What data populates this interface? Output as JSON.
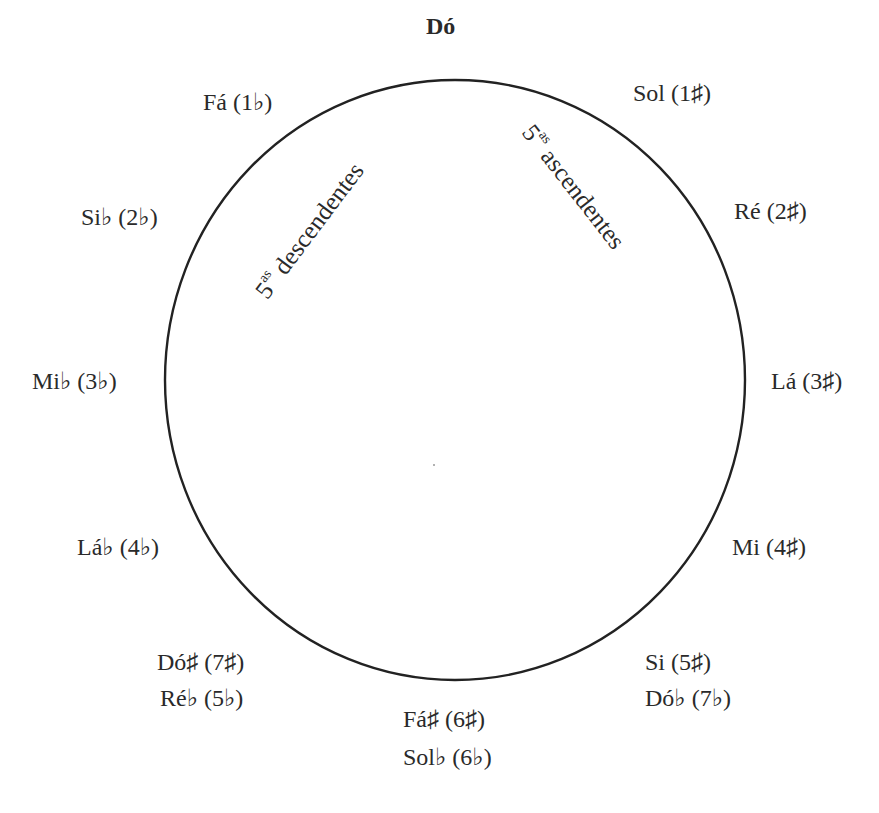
{
  "diagram": {
    "title": "Dó",
    "circle": {
      "cx": 455,
      "cy": 380,
      "rx": 290,
      "ry": 300,
      "stroke": "#222222"
    },
    "keys": {
      "sol": "Sol (1♯)",
      "re": "Ré (2♯)",
      "la": "Lá (3♯)",
      "mi": "Mi (4♯)",
      "si": "Si (5♯)",
      "dob": "Dó♭ (7♭)",
      "fas": "Fá♯ (6♯)",
      "solb": "Sol♭ (6♭)",
      "dos": "Dó♯ (7♯)",
      "reb": "Ré♭ (5♭)",
      "lab": "Lá♭ (4♭)",
      "mib": "Mi♭ (3♭)",
      "sib": "Si♭ (2♭)",
      "fa": "Fá (1♭)"
    },
    "arrows": {
      "ascending_num": "5",
      "ascending_sup": "as",
      "ascending_text": "ascendentes",
      "descending_num": "5",
      "descending_sup": "as",
      "descending_text": "descendentes"
    }
  }
}
